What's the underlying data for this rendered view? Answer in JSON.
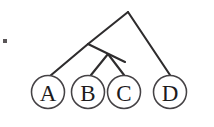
{
  "figure": {
    "caption": "",
    "background_color": "#ffffff",
    "line_color": "#2e2c2d",
    "circle_stroke_color": "#454245",
    "label_color": "#1d1b1c"
  },
  "diagram": {
    "type": "cladogram",
    "root": {
      "x": 128,
      "y": 12
    },
    "nodes": [
      {
        "id": "node-root",
        "x": 128,
        "y": 12,
        "label": ""
      },
      {
        "id": "node-internal-1",
        "x": 88,
        "y": 44,
        "label": ""
      },
      {
        "id": "node-internal-2",
        "x": 108,
        "y": 67,
        "label": ""
      }
    ],
    "leaves": [
      {
        "id": "leaf-a",
        "label": "A",
        "cx": 48,
        "cy": 92,
        "r": 16.5
      },
      {
        "id": "leaf-b",
        "label": "B",
        "cx": 88,
        "cy": 92,
        "r": 16.5
      },
      {
        "id": "leaf-c",
        "label": "C",
        "cx": 124,
        "cy": 92,
        "r": 16.5
      },
      {
        "id": "leaf-d",
        "label": "D",
        "cx": 170,
        "cy": 92,
        "r": 16.5
      }
    ],
    "edges": [
      {
        "id": "edge-root-left",
        "from": "node-root",
        "to": "node-internal-1"
      },
      {
        "id": "edge-root-right",
        "from": "node-root",
        "to": "leaf-d"
      },
      {
        "id": "edge-n1-a",
        "from": "node-internal-1",
        "to": "leaf-a"
      },
      {
        "id": "edge-n1-n2",
        "from": "node-internal-1",
        "to": "node-internal-2"
      },
      {
        "id": "edge-n2-b",
        "from": "node-internal-2",
        "to": "leaf-b"
      },
      {
        "id": "edge-n2-c",
        "from": "node-internal-2",
        "to": "leaf-c"
      }
    ],
    "stray_mark": {
      "x": 3,
      "y": 39,
      "width": 4,
      "height": 4
    }
  },
  "labels": {
    "a": "A",
    "b": "B",
    "c": "C",
    "d": "D"
  }
}
